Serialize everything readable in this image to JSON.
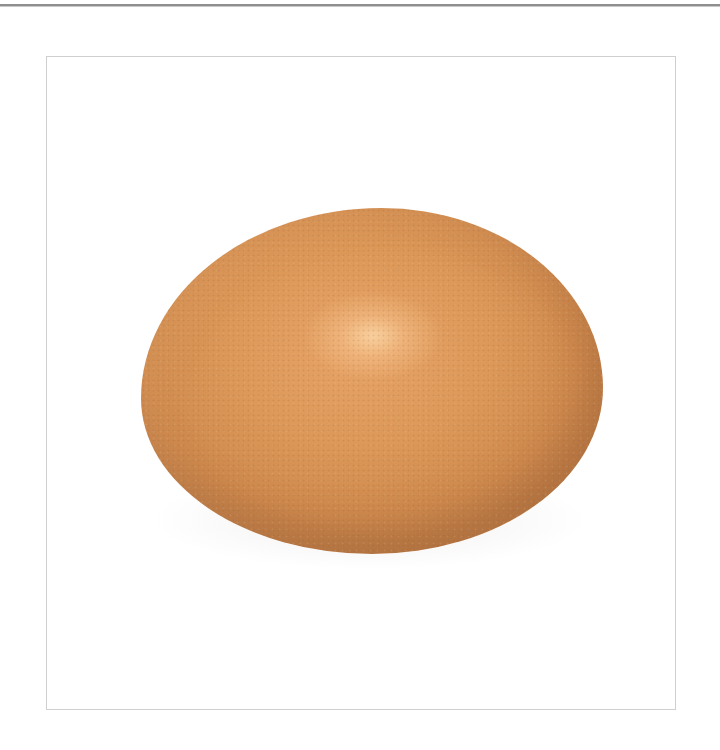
{
  "image": {
    "subject": "brown chicken egg",
    "description": "Single brown egg photographed on a white background inside a thin gray frame",
    "colors": {
      "egg_base": "#dc9858",
      "egg_highlight": "#f5c48e",
      "egg_shadow": "#b97a46",
      "frame_border": "#cfcfcf",
      "top_rule": "#8f8f8f",
      "background": "#ffffff"
    }
  }
}
